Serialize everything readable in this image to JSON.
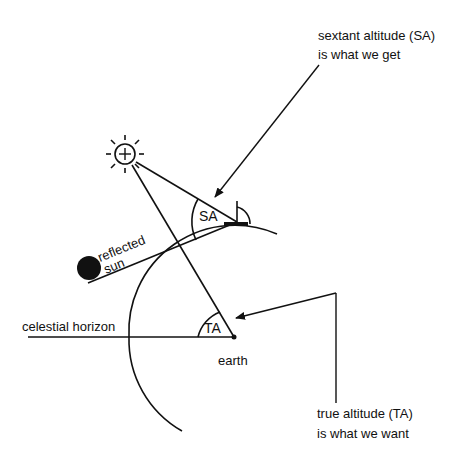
{
  "diagram": {
    "labels": {
      "sa_note_line1": "sextant altitude (SA)",
      "sa_note_line2": "is what we get",
      "ta_note_line1": "true altitude (TA)",
      "ta_note_line2": "is what we want",
      "sa_angle": "SA",
      "ta_angle": "TA",
      "reflected_line1": "reflected",
      "reflected_line2": "sun",
      "celestial_horizon": "celestial horizon",
      "earth": "earth"
    },
    "colors": {
      "ink": "#111111",
      "background": "#ffffff"
    }
  }
}
